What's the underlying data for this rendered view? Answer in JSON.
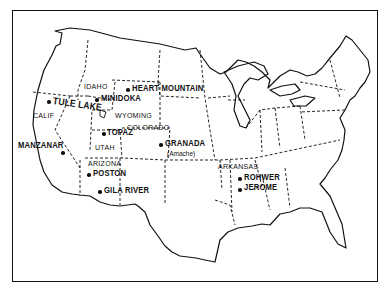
{
  "map": {
    "title": "Japanese American Relocation Centers",
    "camps": [
      {
        "name": "TULE LAKE",
        "x": 48,
        "y": 101
      },
      {
        "name": "MINIDOKA",
        "x": 97,
        "y": 99
      },
      {
        "name": "HEART MOUNTAIN",
        "x": 128,
        "y": 89
      },
      {
        "name": "TOPAZ",
        "x": 104,
        "y": 133
      },
      {
        "name": "MANZANAR",
        "x": 62,
        "y": 152
      },
      {
        "name": "GRANADA",
        "x": 161,
        "y": 144
      },
      {
        "name": "POSTON",
        "x": 89,
        "y": 174
      },
      {
        "name": "GILA RIVER",
        "x": 100,
        "y": 191
      },
      {
        "name": "ROHWER",
        "x": 240,
        "y": 178
      },
      {
        "name": "JEROME",
        "x": 240,
        "y": 188
      }
    ],
    "granada_alias": "(Amache)",
    "states": [
      "IDAHO",
      "WYOMING",
      "CALIF",
      "UTAH",
      "COLORADO",
      "ARIZONA",
      "ARKANSAS"
    ]
  }
}
